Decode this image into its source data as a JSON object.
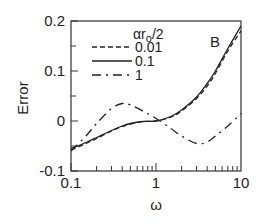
{
  "chart_data": {
    "type": "line",
    "title": "",
    "panel_label": "B",
    "xlabel": "ω",
    "ylabel": "Error",
    "xscale": "log",
    "xlim": [
      0.1,
      10
    ],
    "ylim": [
      -0.1,
      0.2
    ],
    "xticks": [
      {
        "value": 0.1,
        "label": "0.1"
      },
      {
        "value": 1,
        "label": "1"
      },
      {
        "value": 10,
        "label": "10"
      }
    ],
    "yticks": [
      {
        "value": -0.1,
        "label": "-0.1"
      },
      {
        "value": 0,
        "label": "0"
      },
      {
        "value": 0.1,
        "label": "0.1"
      },
      {
        "value": 0.2,
        "label": "0.2"
      }
    ],
    "grid": false,
    "legend_title": "αr",
    "legend_title_sub": "o",
    "legend_title_suffix": "/2",
    "legend_position": "upper-left-inside",
    "x": [
      0.1,
      0.15,
      0.2,
      0.3,
      0.4,
      0.5,
      0.7,
      1.0,
      1.5,
      2.0,
      3.0,
      4.0,
      5.0,
      7.0,
      10.0
    ],
    "series": [
      {
        "name": "0.01",
        "style": "dashed",
        "values": [
          -0.058,
          -0.045,
          -0.035,
          -0.02,
          -0.011,
          -0.006,
          -0.001,
          0.0,
          0.008,
          0.02,
          0.045,
          0.07,
          0.095,
          0.14,
          0.18
        ]
      },
      {
        "name": "0.1",
        "style": "solid",
        "values": [
          -0.055,
          -0.043,
          -0.033,
          -0.019,
          -0.01,
          -0.005,
          -0.001,
          0.0,
          0.009,
          0.022,
          0.048,
          0.075,
          0.1,
          0.145,
          0.19
        ]
      },
      {
        "name": "1",
        "style": "dash-dot",
        "values": [
          -0.06,
          -0.03,
          -0.005,
          0.025,
          0.035,
          0.032,
          0.02,
          0.005,
          -0.015,
          -0.03,
          -0.045,
          -0.042,
          -0.03,
          -0.01,
          0.015
        ]
      }
    ]
  }
}
